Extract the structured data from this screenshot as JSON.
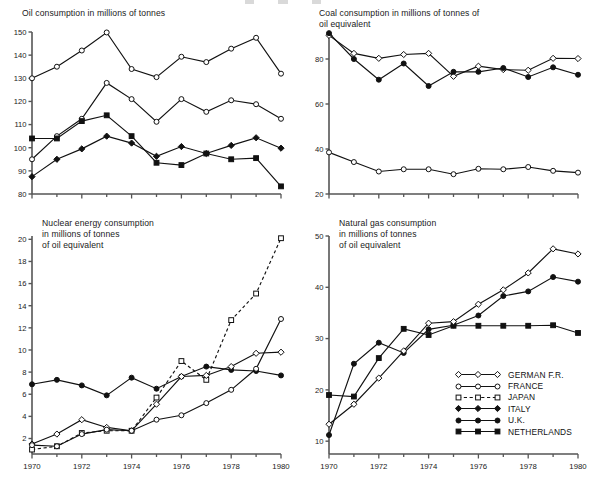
{
  "figure": {
    "background": "#ffffff",
    "ink": "#111111",
    "x_axis_years": [
      1970,
      1971,
      1972,
      1973,
      1974,
      1975,
      1976,
      1977,
      1978,
      1979,
      1980
    ],
    "x_tick_labels": [
      "1970",
      "1972",
      "1974",
      "1976",
      "1978",
      "1980"
    ]
  },
  "legend": {
    "position": "bottom-right of natural-gas panel",
    "entries": [
      {
        "label": "GERMAN F.R.",
        "marker": "open-diamond",
        "line": "solid"
      },
      {
        "label": "FRANCE",
        "marker": "open-circle",
        "line": "solid"
      },
      {
        "label": "JAPAN",
        "marker": "open-square",
        "line": "dashed"
      },
      {
        "label": "ITALY",
        "marker": "filled-diamond",
        "line": "solid"
      },
      {
        "label": "U.K.",
        "marker": "filled-circle",
        "line": "solid"
      },
      {
        "label": "NETHERLANDS",
        "marker": "filled-square",
        "line": "solid"
      }
    ]
  },
  "chart_data": [
    {
      "id": "oil",
      "type": "line",
      "title": "Oil consumption in millions of tonnes",
      "xlabel": "",
      "ylabel": "",
      "x": [
        1970,
        1971,
        1972,
        1973,
        1974,
        1975,
        1976,
        1977,
        1978,
        1979,
        1980
      ],
      "xlim": [
        1970,
        1980
      ],
      "ylim": [
        80,
        150
      ],
      "yticks": [
        80,
        90,
        100,
        110,
        120,
        130,
        140,
        150
      ],
      "ytick_labels": [
        "80",
        "90",
        "100",
        "110",
        "120",
        "130",
        "140",
        "150"
      ],
      "xtick_labels_shown": false,
      "grid": false,
      "series": [
        {
          "name": "GERMAN F.R.",
          "marker": "open-circle",
          "line": "solid",
          "values": [
            130.0,
            135.0,
            142.0,
            149.8,
            134.0,
            130.5,
            139.3,
            137.0,
            142.8,
            147.5,
            132.0
          ]
        },
        {
          "name": "FRANCE",
          "marker": "open-circle",
          "line": "solid",
          "values": [
            95.0,
            105.0,
            112.5,
            128.0,
            121.0,
            111.2,
            121.0,
            115.5,
            120.5,
            118.8,
            112.5
          ]
        },
        {
          "name": "NETHERLANDS",
          "marker": "filled-square",
          "line": "solid",
          "values": [
            104.0,
            104.0,
            111.5,
            114.0,
            105.0,
            93.5,
            92.5,
            97.5,
            95.0,
            95.5,
            83.3
          ]
        },
        {
          "name": "ITALY",
          "marker": "filled-diamond",
          "line": "solid",
          "values": [
            87.5,
            95.0,
            99.5,
            105.0,
            102.0,
            96.3,
            100.5,
            97.5,
            101.0,
            104.3,
            99.8
          ]
        }
      ]
    },
    {
      "id": "coal",
      "type": "line",
      "title": "Coal consumption in millions of tonnes of\noil equivalent",
      "xlabel": "",
      "ylabel": "",
      "x": [
        1970,
        1971,
        1972,
        1973,
        1974,
        1975,
        1976,
        1977,
        1978,
        1979,
        1980
      ],
      "xlim": [
        1970,
        1980
      ],
      "ylim": [
        20,
        92
      ],
      "yticks": [
        20,
        40,
        60,
        80
      ],
      "ytick_labels": [
        "20",
        "40",
        "60",
        "80"
      ],
      "xtick_labels_shown": false,
      "grid": false,
      "series": [
        {
          "name": "GERMAN F.R.",
          "marker": "open-diamond",
          "line": "solid",
          "values": [
            90.5,
            82.5,
            80.3,
            82.0,
            82.5,
            72.3,
            76.8,
            75.3,
            75.0,
            80.3,
            80.2
          ]
        },
        {
          "name": "U.K.",
          "marker": "filled-circle",
          "line": "solid",
          "values": [
            91.5,
            80.0,
            70.8,
            78.0,
            68.0,
            74.3,
            74.3,
            76.0,
            72.0,
            76.3,
            73.0
          ]
        },
        {
          "name": "FRANCE",
          "marker": "open-circle",
          "line": "solid",
          "values": [
            38.5,
            34.2,
            30.0,
            31.0,
            31.0,
            28.8,
            31.2,
            31.0,
            32.0,
            30.3,
            29.5
          ]
        }
      ]
    },
    {
      "id": "nuclear",
      "type": "line",
      "title": "Nuclear energy consumption\nin millions of tonnes\nof oil equivalent",
      "xlabel": "",
      "ylabel": "",
      "x": [
        1970,
        1971,
        1972,
        1973,
        1974,
        1975,
        1976,
        1977,
        1978,
        1979,
        1980
      ],
      "xlim": [
        1970,
        1980
      ],
      "ylim": [
        0.6,
        20.3
      ],
      "yticks": [
        2,
        4,
        6,
        8,
        10,
        12,
        14,
        16,
        18,
        20
      ],
      "ytick_labels": [
        "2",
        "4",
        "6",
        "8",
        "10",
        "12",
        "14",
        "16",
        "18",
        "20"
      ],
      "xtick_labels_shown": true,
      "grid": false,
      "series": [
        {
          "name": "U.K.",
          "marker": "filled-circle",
          "line": "solid",
          "values": [
            6.9,
            7.3,
            6.8,
            5.9,
            7.5,
            6.5,
            7.6,
            8.5,
            8.2,
            8.1,
            7.7
          ]
        },
        {
          "name": "JAPAN",
          "marker": "open-square",
          "line": "dashed",
          "values": [
            1.0,
            1.3,
            2.5,
            2.7,
            2.7,
            5.7,
            9.0,
            7.3,
            12.7,
            15.1,
            20.1
          ]
        },
        {
          "name": "GERMAN F.R.",
          "marker": "open-diamond",
          "line": "solid",
          "values": [
            1.5,
            2.4,
            3.7,
            3.0,
            2.7,
            5.1,
            7.6,
            7.7,
            8.5,
            9.7,
            9.8
          ]
        },
        {
          "name": "FRANCE",
          "marker": "open-circle",
          "line": "solid",
          "values": [
            1.4,
            1.3,
            2.4,
            2.8,
            2.7,
            3.7,
            4.1,
            5.2,
            6.4,
            8.3,
            12.8
          ]
        }
      ]
    },
    {
      "id": "natural-gas",
      "type": "line",
      "title": "Natural gas consumption\nin millions of tonnes\nof oil equivalent",
      "xlabel": "",
      "ylabel": "",
      "x": [
        1970,
        1971,
        1972,
        1973,
        1974,
        1975,
        1976,
        1977,
        1978,
        1979,
        1980
      ],
      "xlim": [
        1970,
        1980
      ],
      "ylim": [
        7.5,
        50
      ],
      "yticks": [
        10,
        20,
        30,
        40,
        50
      ],
      "ytick_labels": [
        "10",
        "20",
        "30",
        "40",
        "50"
      ],
      "xtick_labels_shown": true,
      "grid": false,
      "series": [
        {
          "name": "NETHERLANDS",
          "marker": "filled-square",
          "line": "solid",
          "values": [
            19.0,
            18.7,
            26.2,
            31.9,
            30.7,
            32.5,
            32.5,
            32.5,
            32.5,
            32.6,
            31.1
          ]
        },
        {
          "name": "U.K.",
          "marker": "filled-circle",
          "line": "solid",
          "values": [
            11.2,
            25.1,
            29.2,
            27.2,
            31.8,
            32.6,
            34.5,
            38.3,
            39.2,
            42.0,
            41.1
          ]
        },
        {
          "name": "GERMAN F.R.",
          "marker": "open-diamond",
          "line": "solid",
          "values": [
            13.3,
            17.2,
            22.3,
            27.6,
            33.0,
            33.3,
            36.7,
            39.5,
            42.8,
            47.5,
            46.5
          ]
        }
      ]
    }
  ]
}
